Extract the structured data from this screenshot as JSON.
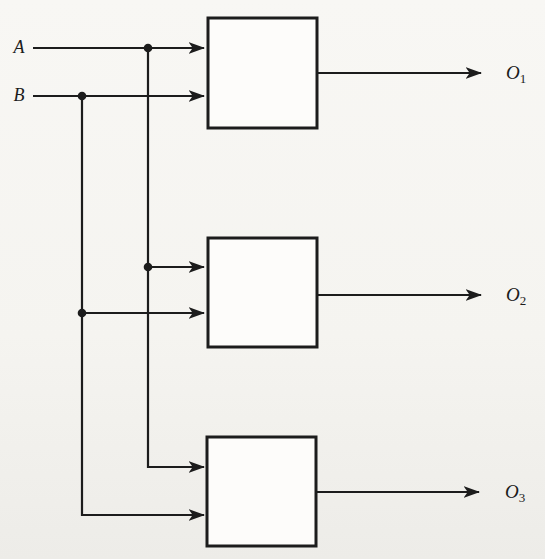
{
  "diagram": {
    "colors": {
      "background": "#f5f4f0",
      "line": "#1c1c1c",
      "block_fill": "#fdfcfa"
    },
    "inputs": [
      {
        "label": "A"
      },
      {
        "label": "B"
      }
    ],
    "outputs": [
      {
        "base": "O",
        "sub": "1"
      },
      {
        "base": "O",
        "sub": "2"
      },
      {
        "base": "O",
        "sub": "3"
      }
    ]
  }
}
